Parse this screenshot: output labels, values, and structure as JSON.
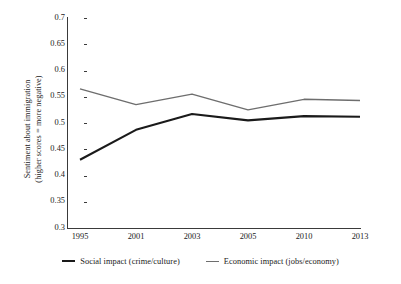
{
  "chart_data": {
    "type": "line",
    "title": "",
    "xlabel": "",
    "ylabel": "Sentiment about immigration (higher scores = more negative)",
    "ylabel_lines": [
      "Sentiment about immigration",
      "(higher scores = more negative)"
    ],
    "categories": [
      "1995",
      "2001",
      "2003",
      "2005",
      "2010",
      "2013"
    ],
    "x": [
      1995,
      2001,
      2003,
      2005,
      2010,
      2013
    ],
    "ylim": [
      0.3,
      0.7
    ],
    "ytick_values": [
      0.3,
      0.35,
      0.4,
      0.45,
      0.5,
      0.55,
      0.6,
      0.65,
      0.7
    ],
    "ytick_labels": [
      "0.3",
      "0.35",
      "0.4",
      "0.45",
      "0.5",
      "0.55",
      "0.6",
      "0.65",
      "0.7"
    ],
    "grid": false,
    "legend_position": "bottom",
    "series": [
      {
        "name": "Social impact (crime/culture)",
        "values": [
          0.43,
          0.487,
          0.517,
          0.505,
          0.513,
          0.512
        ],
        "color": "#1a1a1a",
        "line_width": 2.1
      },
      {
        "name": "Economic impact (jobs/economy)",
        "values": [
          0.565,
          0.535,
          0.555,
          0.525,
          0.545,
          0.543
        ],
        "color": "#6e6e6e",
        "line_width": 1.5
      }
    ]
  },
  "axes": {
    "left_axis_color": "#3a3a3a",
    "bottom_axis_color": "#3a3a3a"
  },
  "legend": {
    "items": [
      {
        "label": "Social impact (crime/culture)",
        "color": "#1a1a1a",
        "width": "2.1px"
      },
      {
        "label": "Economic impact (jobs/economy)",
        "color": "#6e6e6e",
        "width": "1.5px"
      }
    ]
  }
}
